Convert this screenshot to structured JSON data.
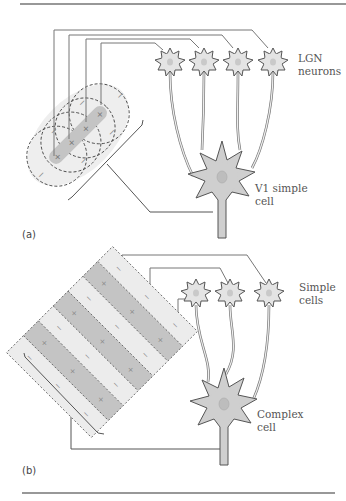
{
  "figure": {
    "panel_a": {
      "label": "(a)",
      "top_cells_label_line1": "LGN",
      "top_cells_label_line2": "neurons",
      "bottom_cell_label_line1": "V1 simple",
      "bottom_cell_label_line2": "cell",
      "receptive_field": {
        "center_sign": "+",
        "surround_sign": "−",
        "count": 4
      }
    },
    "panel_b": {
      "label": "(b)",
      "top_cells_label_line1": "Simple",
      "top_cells_label_line2": "cells",
      "bottom_cell_label_line1": "Complex",
      "bottom_cell_label_line2": "cell",
      "receptive_field": {
        "on_sign": "+",
        "off_sign": "−",
        "stripes": 7
      }
    }
  },
  "colors": {
    "rule": "#333333",
    "wire": "#666666",
    "cell_fill": "#e4e4e4",
    "cell_stroke": "#555555",
    "big_cell_fill": "#cfcfcf",
    "nucleus": "#bdbdbd",
    "field_light": "#ececec",
    "field_dark": "#c4c4c4"
  }
}
